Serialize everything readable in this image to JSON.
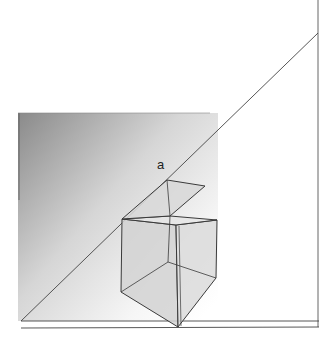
{
  "diagram": {
    "type": "perspective-drawing",
    "labels": [
      {
        "id": "point-a",
        "text": "a",
        "x": 157,
        "y": 157
      }
    ],
    "colors": {
      "background": "#ffffff",
      "line": "#3a3a3a",
      "box_fill": "#d4d4d4",
      "gradient_dark": "#8a8a8a",
      "gradient_light": "#ffffff"
    }
  }
}
